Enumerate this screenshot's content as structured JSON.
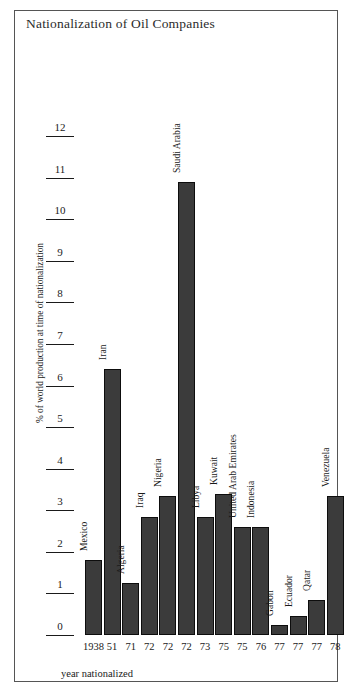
{
  "figure": {
    "title": "Nationalization of Oil Companies",
    "border_color": "#555555",
    "background": "#ffffff"
  },
  "chart_data": {
    "type": "bar",
    "title": "Nationalization of Oil Companies",
    "xlabel": "year nationalized",
    "ylabel": "% of world production at time of nationalization",
    "ylim": [
      0,
      12
    ],
    "yticks": [
      0,
      1,
      2,
      3,
      4,
      5,
      6,
      7,
      8,
      9,
      10,
      11,
      12
    ],
    "ytick_labels": [
      "0",
      "1",
      "2",
      "3",
      "4",
      "5",
      "6",
      "7",
      "8",
      "9",
      "10",
      "11",
      "12"
    ],
    "grid": false,
    "legend": "none",
    "bar_color": "#3b3b3b",
    "bar_edge_color": "#0d0d0d",
    "categories": [
      "Mexico",
      "Iran",
      "Algeria",
      "Iraq",
      "Nigeria",
      "Saudi Arabia",
      "Libya",
      "Kuwait",
      "United Arab Emirates",
      "Indonesia",
      "Gabon",
      "Ecuador",
      "Qatar",
      "Venezuela"
    ],
    "x": [
      "1938",
      "51",
      "71",
      "72",
      "72",
      "72",
      "73",
      "75",
      "75",
      "76",
      "77",
      "77",
      "77",
      "78"
    ],
    "values": [
      1.8,
      6.4,
      1.25,
      2.85,
      3.35,
      10.9,
      2.85,
      3.4,
      2.6,
      2.6,
      0.25,
      0.45,
      0.85,
      3.35
    ],
    "bars": [
      {
        "country": "Mexico",
        "year": "1938",
        "value": 1.8
      },
      {
        "country": "Iran",
        "year": "51",
        "value": 6.4
      },
      {
        "country": "Algeria",
        "year": "71",
        "value": 1.25
      },
      {
        "country": "Iraq",
        "year": "72",
        "value": 2.85
      },
      {
        "country": "Nigeria",
        "year": "72",
        "value": 3.35
      },
      {
        "country": "Saudi Arabia",
        "year": "72",
        "value": 10.9
      },
      {
        "country": "Libya",
        "year": "73",
        "value": 2.85
      },
      {
        "country": "Kuwait",
        "year": "75",
        "value": 3.4
      },
      {
        "country": "United Arab Emirates",
        "year": "75",
        "value": 2.6
      },
      {
        "country": "Indonesia",
        "year": "76",
        "value": 2.6
      },
      {
        "country": "Gabon",
        "year": "77",
        "value": 0.25
      },
      {
        "country": "Ecuador",
        "year": "77",
        "value": 0.45
      },
      {
        "country": "Qatar",
        "year": "77",
        "value": 0.85
      },
      {
        "country": "Venezuela",
        "year": "78",
        "value": 3.35
      }
    ]
  }
}
